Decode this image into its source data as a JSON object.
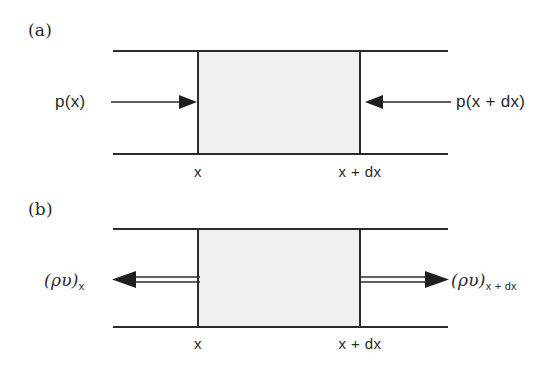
{
  "figure": {
    "background_color": "#ffffff",
    "line_color": "#2b2b2b",
    "fill_color": "#f0f0f0",
    "text_color": "#2a2a2a"
  },
  "panels": [
    {
      "letter": "(a)",
      "quantity": "pressure",
      "left_label": "p(x)",
      "right_label": "p(x + dx)",
      "left_tick": "x",
      "right_tick": "x + dx",
      "arrow_style": "single-line",
      "left_arrow_direction": "right",
      "right_arrow_direction": "left"
    },
    {
      "letter": "(b)",
      "quantity": "mass-flux",
      "left_label_base": "(ρυ)",
      "left_label_sub": "x",
      "right_label_base": "(ρυ)",
      "right_label_sub": "x + dx",
      "left_tick": "x",
      "right_tick": "x + dx",
      "arrow_style": "double-line",
      "left_arrow_direction": "left",
      "right_arrow_direction": "right"
    }
  ]
}
